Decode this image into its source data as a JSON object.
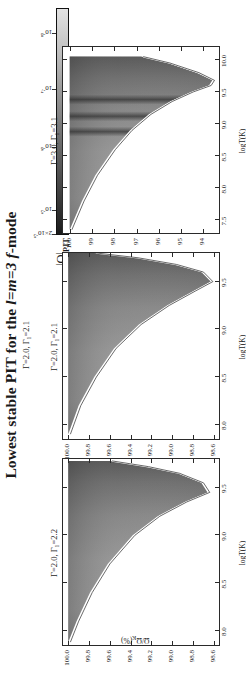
{
  "figure": {
    "title_pre": "Lowest stable PIT for the ",
    "title_italic": "l=m=3 f",
    "title_post": "-mode",
    "subtitle": "Γ=2.0, Γ₁=2.1"
  },
  "colorbar": {
    "label_main": "|Q|",
    "label_sub": "PIT",
    "ticks": [
      "2×10⁻⁵",
      "10⁻⁵",
      "10⁻⁶",
      "10⁻⁷",
      "10⁻⁸"
    ],
    "tick_positions": [
      0.0,
      0.105,
      0.385,
      0.645,
      0.895
    ],
    "ramp_dark": "#1b1b1b",
    "ramp_light": "#e2e2e2"
  },
  "axes": {
    "xlabel": "logT(K)",
    "ylabel_pre": "Ω/Ω",
    "ylabel_sub": "K",
    "ylabel_post": "(%)"
  },
  "chart_data": [
    {
      "type": "heatmap",
      "panel_id": "panel-left",
      "tag": "Γ=2.0, Γ₁=2.2",
      "xlabel": "logT(K)",
      "ylabel": "Ω/Ω_K(%)",
      "xlim": [
        7.85,
        9.8
      ],
      "ylim": [
        98.55,
        100.05
      ],
      "xticks": [
        8.0,
        8.5,
        9.0,
        9.5
      ],
      "xticklabels": [
        "8.0",
        "8.5",
        "9.0",
        "9.5"
      ],
      "yticks": [
        100.0,
        99.8,
        99.6,
        99.4,
        99.2,
        99.0,
        98.8,
        98.6
      ],
      "yticklabels": [
        "100.0",
        "99.8",
        "99.6",
        "99.4",
        "99.2",
        "99.0",
        "98.8",
        "98.6"
      ],
      "grid": false,
      "colorscale": "greyscale-inverted",
      "description": "Wedge-shaped instability region; upper stability curve descends from 100% at logT=7.9 to a minimum near 98.6% at logT=9.45 then rises.",
      "boundary_upper": [
        [
          7.88,
          100.0
        ],
        [
          8.1,
          99.92
        ],
        [
          8.4,
          99.79
        ],
        [
          8.7,
          99.62
        ],
        [
          9.0,
          99.38
        ],
        [
          9.2,
          99.14
        ],
        [
          9.35,
          98.88
        ],
        [
          9.45,
          98.66
        ],
        [
          9.55,
          98.72
        ],
        [
          9.65,
          98.95
        ],
        [
          9.72,
          99.25
        ],
        [
          9.78,
          99.6
        ]
      ],
      "boundary_lower": [
        [
          7.88,
          100.0
        ],
        [
          8.3,
          100.0
        ],
        [
          8.8,
          100.0
        ],
        [
          9.3,
          100.0
        ],
        [
          9.78,
          100.0
        ]
      ],
      "fill_top_value": 100.0,
      "intensity_min": 1e-08,
      "intensity_max": 2e-05
    },
    {
      "type": "heatmap",
      "panel_id": "panel-middle",
      "tag": "Γ=2.0, Γ₁=2.1",
      "xlabel": "logT(K)",
      "ylabel": "Ω/Ω_K(%)",
      "xlim": [
        7.85,
        9.8
      ],
      "ylim": [
        98.55,
        100.05
      ],
      "xticks": [
        8.0,
        8.5,
        9.0,
        9.5
      ],
      "xticklabels": [
        "8.0",
        "8.5",
        "9.0",
        "9.5"
      ],
      "yticks": [
        100.0,
        99.8,
        99.6,
        99.4,
        99.2,
        99.0,
        98.8,
        98.6
      ],
      "yticklabels": [
        "100.0",
        "99.8",
        "99.6",
        "99.4",
        "99.2",
        "99.0",
        "98.8",
        "98.6"
      ],
      "grid": false,
      "colorscale": "greyscale-inverted",
      "description": "Similar wedge; slightly broader shaded region reaching lower Ω/Ω_K near logT=9.5.",
      "boundary_upper": [
        [
          7.9,
          100.0
        ],
        [
          8.2,
          99.9
        ],
        [
          8.5,
          99.75
        ],
        [
          8.8,
          99.56
        ],
        [
          9.05,
          99.32
        ],
        [
          9.25,
          99.05
        ],
        [
          9.4,
          98.8
        ],
        [
          9.5,
          98.63
        ],
        [
          9.6,
          98.72
        ],
        [
          9.68,
          98.98
        ],
        [
          9.75,
          99.35
        ],
        [
          9.8,
          99.75
        ]
      ],
      "boundary_lower": [
        [
          7.9,
          100.0
        ],
        [
          8.4,
          100.0
        ],
        [
          8.9,
          100.0
        ],
        [
          9.4,
          100.0
        ],
        [
          9.8,
          100.0
        ]
      ],
      "fill_top_value": 100.0,
      "intensity_min": 1e-08,
      "intensity_max": 2e-05
    },
    {
      "type": "heatmap",
      "panel_id": "panel-right",
      "tag": "Γ=3.0, Γ₁=3.1",
      "xlabel": "logT(K)",
      "ylabel": "Ω/Ω_K(%)",
      "xlim": [
        7.3,
        10.2
      ],
      "ylim": [
        93.3,
        100.3
      ],
      "xticks": [
        7.5,
        8.0,
        8.5,
        9.0,
        9.5,
        10.0
      ],
      "xticklabels": [
        "7.5",
        "8.0",
        "8.5",
        "9.0",
        "9.5",
        "10.0"
      ],
      "yticks": [
        100,
        99,
        98,
        97,
        96,
        95,
        94
      ],
      "yticklabels": [
        "100",
        "99",
        "98",
        "97",
        "96",
        "95",
        "94"
      ],
      "grid": false,
      "colorscale": "greyscale-inverted",
      "description": "Wide wedge with three dark vertical resonance stripes near logT=8.9, 9.15 and 9.4; upper boundary drops from 100% to about 93.6% near logT=9.6 then rises steeply.",
      "boundary_upper": [
        [
          7.35,
          100.0
        ],
        [
          7.8,
          99.45
        ],
        [
          8.2,
          98.85
        ],
        [
          8.6,
          98.05
        ],
        [
          8.9,
          97.3
        ],
        [
          9.15,
          96.45
        ],
        [
          9.35,
          95.5
        ],
        [
          9.5,
          94.55
        ],
        [
          9.6,
          93.75
        ],
        [
          9.68,
          93.6
        ],
        [
          9.8,
          94.3
        ],
        [
          9.95,
          95.6
        ],
        [
          10.05,
          96.8
        ]
      ],
      "boundary_lower": [
        [
          7.35,
          100.0
        ],
        [
          8.2,
          100.0
        ],
        [
          9.0,
          100.0
        ],
        [
          9.7,
          100.0
        ],
        [
          10.05,
          100.0
        ]
      ],
      "dark_stripes_logT": [
        8.88,
        9.12,
        9.38
      ],
      "fill_top_value": 100.0,
      "intensity_min": 1e-08,
      "intensity_max": 2e-05
    }
  ]
}
